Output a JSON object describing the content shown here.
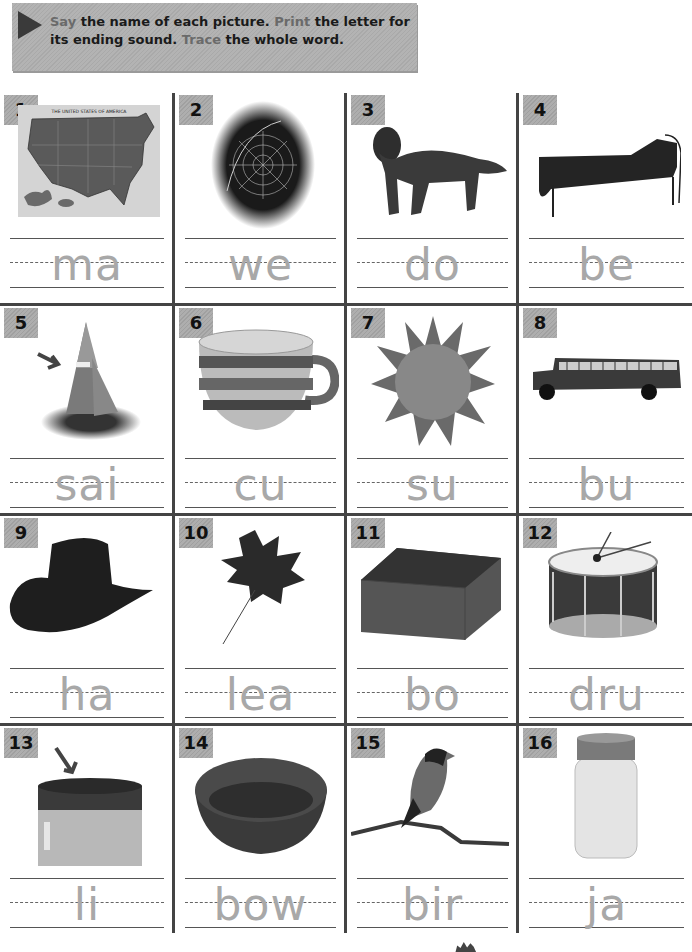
{
  "instructions": {
    "say": "Say",
    "part1": " the name of each picture. ",
    "print": "Print",
    "part2": " the letter for its ending sound. ",
    "trace": "Trace",
    "part3": " the whole word."
  },
  "colors": {
    "header_bg": "#b0b0b0",
    "badge_bg": "#a8a8a8",
    "grid_line": "#444444",
    "trace_text": "#a8a8a8",
    "highlight_word": "#6a6a6a"
  },
  "items": [
    {
      "number": "1",
      "picture": "map",
      "word_stub": "ma",
      "map_title": "THE UNITED STATES OF AMERICA"
    },
    {
      "number": "2",
      "picture": "spider-web",
      "word_stub": "we"
    },
    {
      "number": "3",
      "picture": "dog",
      "word_stub": "do"
    },
    {
      "number": "4",
      "picture": "bed",
      "word_stub": "be"
    },
    {
      "number": "5",
      "picture": "sailboat",
      "word_stub": "sai",
      "has_arrow": true
    },
    {
      "number": "6",
      "picture": "cup",
      "word_stub": "cu"
    },
    {
      "number": "7",
      "picture": "sun",
      "word_stub": "su"
    },
    {
      "number": "8",
      "picture": "bus",
      "word_stub": "bu"
    },
    {
      "number": "9",
      "picture": "hat",
      "word_stub": "ha"
    },
    {
      "number": "10",
      "picture": "leaf",
      "word_stub": "lea"
    },
    {
      "number": "11",
      "picture": "box",
      "word_stub": "bo"
    },
    {
      "number": "12",
      "picture": "drum",
      "word_stub": "dru"
    },
    {
      "number": "13",
      "picture": "jar-lid",
      "word_stub": "li",
      "has_arrow": true
    },
    {
      "number": "14",
      "picture": "bowl",
      "word_stub": "bow"
    },
    {
      "number": "15",
      "picture": "bird",
      "word_stub": "bir"
    },
    {
      "number": "16",
      "picture": "jar",
      "word_stub": "ja"
    }
  ]
}
